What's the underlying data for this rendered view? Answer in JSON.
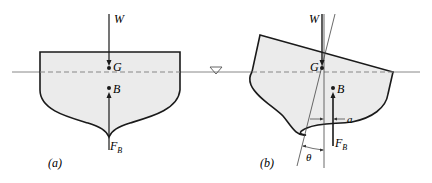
{
  "figure": {
    "colors": {
      "hull_fill": "#ebebeb",
      "hull_stroke": "#1a1a1a",
      "waterline": "#777777",
      "background": "#ffffff"
    },
    "panel_a": {
      "caption": "(a)",
      "weight_label": "W",
      "gravity_label": "G",
      "buoyancy_center_label": "B",
      "buoyant_force_label": "F",
      "buoyant_force_subscript": "B"
    },
    "panel_b": {
      "caption": "(b)",
      "weight_label": "W",
      "gravity_label": "G",
      "buoyancy_center_label": "B",
      "buoyant_force_label": "F",
      "buoyant_force_subscript": "B",
      "offset_label": "a",
      "angle_label": "θ"
    },
    "free_surface_symbol": "▽"
  }
}
